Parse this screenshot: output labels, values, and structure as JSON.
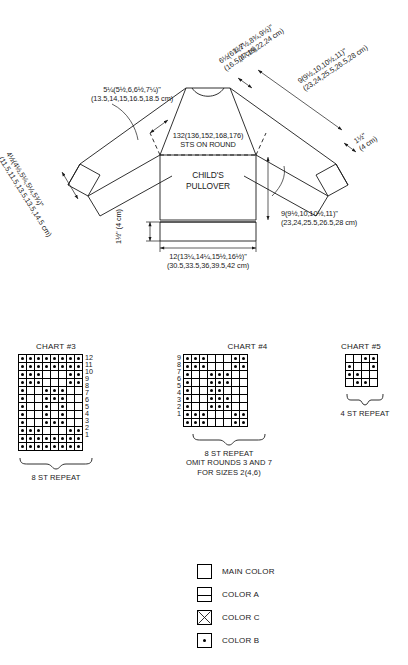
{
  "schematic": {
    "body_label_line1": "CHILD'S",
    "body_label_line2": "PULLOVER",
    "sts_line1": "132(136,152,168,176)",
    "sts_line2": "STS ON ROUND",
    "shoulder": {
      "inches": "5¼(5½,6,6½,7¼)\"",
      "cm": "(13.5,14,15,16.5,18.5 cm)"
    },
    "sleeve_upper": {
      "inches": "6½(6¾,7½,8¾,9½)\"",
      "cm": "(16.5,17,19,22,24 cm)"
    },
    "sleeve_length": {
      "inches": "9(9½,10,10½,11)\"",
      "cm": "(23,24,25.5,26.5,28 cm)"
    },
    "cuff": {
      "inches": "4½(4½,5¼,5¼,5¾)\"",
      "cm": "(11.5,11.5,13.5,13.5,14.5 cm)"
    },
    "body_length": {
      "inches": "9(9½,10,10½,11)\"",
      "cm": "(23,24,25.5,26.5,28 cm)"
    },
    "body_width": {
      "inches": "12(13¼,14¼,15½,16½)\"",
      "cm": "(30.5,33.5,36,39.5,42 cm)"
    },
    "ribbing_body": {
      "inches": "1½\"",
      "cm": "(4 cm)"
    },
    "ribbing_cuff_left": {
      "inches": "1½\"",
      "cm": "(4 cm)"
    },
    "ribbing_cuff_right": {
      "inches": "1½\"",
      "cm": "(4 cm)"
    },
    "ribbing_top_right": {
      "inches": "1½\"",
      "cm": "(4 cm)"
    }
  },
  "charts": [
    {
      "id": "chart-3",
      "title": "CHART #3",
      "columns": 8,
      "rows": 12,
      "row_numbers": [
        12,
        11,
        10,
        9,
        8,
        7,
        6,
        5,
        4,
        3,
        2,
        1
      ],
      "row_label_side": "right",
      "caption_lines": [
        "8 ST REPEAT"
      ],
      "grid": [
        [
          1,
          1,
          1,
          1,
          1,
          1,
          1,
          1
        ],
        [
          1,
          1,
          1,
          1,
          1,
          1,
          1,
          1
        ],
        [
          1,
          1,
          1,
          0,
          0,
          0,
          1,
          1
        ],
        [
          1,
          1,
          1,
          0,
          0,
          0,
          1,
          1
        ],
        [
          1,
          0,
          0,
          1,
          1,
          1,
          0,
          0
        ],
        [
          1,
          0,
          0,
          1,
          1,
          1,
          0,
          0
        ],
        [
          1,
          0,
          0,
          1,
          0,
          1,
          0,
          0
        ],
        [
          1,
          0,
          0,
          1,
          0,
          1,
          0,
          0
        ],
        [
          1,
          0,
          0,
          1,
          1,
          1,
          0,
          0
        ],
        [
          1,
          1,
          1,
          0,
          0,
          0,
          1,
          1
        ],
        [
          1,
          1,
          1,
          1,
          1,
          1,
          1,
          1
        ],
        [
          1,
          1,
          1,
          1,
          1,
          1,
          1,
          1
        ]
      ]
    },
    {
      "id": "chart-4",
      "title": "CHART #4",
      "columns": 8,
      "rows": 9,
      "row_numbers": [
        9,
        8,
        7,
        6,
        5,
        4,
        3,
        2,
        1
      ],
      "row_label_side": "left",
      "caption_lines": [
        "8 ST REPEAT",
        "OMIT ROUNDS 3 AND 7",
        "FOR SIZES 2(4,6)"
      ],
      "grid": [
        [
          1,
          1,
          1,
          0,
          0,
          0,
          1,
          1
        ],
        [
          1,
          1,
          1,
          0,
          0,
          0,
          1,
          1
        ],
        [
          1,
          0,
          0,
          1,
          1,
          1,
          0,
          0
        ],
        [
          1,
          0,
          0,
          1,
          1,
          1,
          0,
          0
        ],
        [
          1,
          0,
          0,
          1,
          1,
          0,
          0,
          0
        ],
        [
          1,
          0,
          0,
          1,
          1,
          1,
          0,
          0
        ],
        [
          1,
          0,
          0,
          1,
          1,
          1,
          0,
          0
        ],
        [
          1,
          1,
          1,
          0,
          0,
          0,
          1,
          1
        ],
        [
          1,
          1,
          1,
          0,
          0,
          0,
          1,
          1
        ]
      ]
    },
    {
      "id": "chart-5",
      "title": "CHART #5",
      "columns": 4,
      "rows": 4,
      "row_numbers": [],
      "row_label_side": "none",
      "caption_lines": [
        "4 ST REPEAT"
      ],
      "grid": [
        [
          0,
          0,
          1,
          1
        ],
        [
          1,
          0,
          0,
          1
        ],
        [
          1,
          1,
          0,
          0
        ],
        [
          0,
          1,
          1,
          0
        ]
      ]
    }
  ],
  "legend": {
    "items": [
      {
        "swatch": "main-color-swatch",
        "label": "MAIN COLOR"
      },
      {
        "swatch": "color-a-swatch",
        "label": "COLOR A"
      },
      {
        "swatch": "color-c-swatch",
        "label": "COLOR C"
      },
      {
        "swatch": "color-b-swatch",
        "label": "COLOR B"
      }
    ]
  }
}
